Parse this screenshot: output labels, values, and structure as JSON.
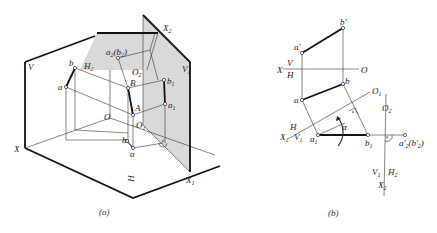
{
  "figure_a": {
    "caption": "(a)",
    "labels": {
      "V": "V",
      "H": "H",
      "X": "X",
      "O": "O",
      "O1": "O",
      "O1_sub": "1",
      "O2": "O",
      "O2_sub": "2",
      "X1": "X",
      "X1_sub": "1",
      "X2": "X",
      "X2_sub": "2",
      "H2": "H",
      "H2_sub": "2",
      "V1": "V",
      "V1_sub": "1",
      "A": "A",
      "B": "B",
      "a_prime": "a",
      "b_prime": "b",
      "a": "a",
      "b": "b",
      "a1": "a",
      "a1_sub": "1",
      "b1": "b",
      "b1_sub": "1",
      "a2b2": "a",
      "a2b2_sub": "2",
      "a2b2_paren": "(b",
      "a2b2_paren_sub": "2",
      "a2b2_close": ")"
    }
  },
  "figure_b": {
    "caption": "(b)",
    "labels": {
      "X": "X",
      "V": "V",
      "H": "H",
      "O": "O",
      "a_prime": "a'",
      "b_prime": "b'",
      "a": "a",
      "b": "b",
      "O1": "O",
      "O1_sub": "1",
      "O2": "O",
      "O2_sub": "2",
      "H_axis1": "H",
      "X1": "X",
      "X1_sub": "1",
      "V1": "V",
      "V1_sub": "1",
      "a1": "a",
      "a1_sub": "1",
      "b1": "b",
      "b1_sub": "1",
      "alpha": "α",
      "a2b2": "a'",
      "a2b2_sub": "2",
      "a2b2_paren": "(b'",
      "a2b2_paren_sub": "2",
      "a2b2_close": ")",
      "V1_axis2": "V",
      "V1_axis2_sub": "1",
      "H2": "H",
      "H2_sub": "2",
      "X2": "X",
      "X2_sub": "2"
    }
  }
}
